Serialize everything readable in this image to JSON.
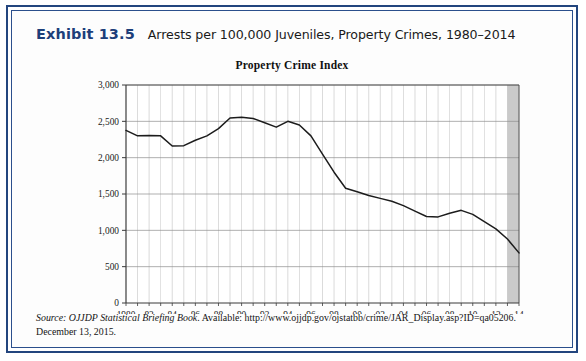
{
  "exhibit": {
    "number": "Exhibit 13.5",
    "caption": "Arrests per 100,000 Juveniles, Property Crimes, 1980–2014"
  },
  "source": {
    "label": "Source:",
    "publication": " OJJDP Statistical Briefing Book",
    "rest": ". Available: http://www.ojjdp.gov/ojstatbb/crime/JAR_Display.asp?ID=qa05206.",
    "line2": "December 13, 2015."
  },
  "colors": {
    "frame_border": "#23457e",
    "exhibit_number": "#1d3f7a",
    "line": "#1c1c1c",
    "grid": "#b9b9b9",
    "axis": "#4a4a4a",
    "shaded_band": "#b8b8b8"
  },
  "chart_data": {
    "type": "line",
    "title": "Property Crime Index",
    "xlabel": "",
    "ylabel": "",
    "xlim": [
      1980,
      2014
    ],
    "ylim": [
      0,
      3000
    ],
    "ytick_values": [
      0,
      500,
      1000,
      1500,
      2000,
      2500,
      3000
    ],
    "ytick_labels": [
      "0",
      "500",
      "1,000",
      "1,500",
      "2,000",
      "2,500",
      "3,000"
    ],
    "xtick_values": [
      1980,
      1982,
      1984,
      1986,
      1988,
      1990,
      1992,
      1994,
      1996,
      1998,
      2000,
      2002,
      2004,
      2006,
      2008,
      2010,
      2012,
      2014
    ],
    "xtick_labels": [
      "1980",
      "82",
      "84",
      "86",
      "88",
      "90",
      "92",
      "94",
      "96",
      "98",
      "00",
      "02",
      "04",
      "06",
      "08",
      "10",
      "12",
      "14"
    ],
    "grid": true,
    "legend": false,
    "shaded_region": {
      "from": 2013,
      "to": 2014
    },
    "x": [
      1980,
      1981,
      1982,
      1983,
      1984,
      1985,
      1986,
      1987,
      1988,
      1989,
      1990,
      1991,
      1992,
      1993,
      1994,
      1995,
      1996,
      1997,
      1998,
      1999,
      2000,
      2001,
      2002,
      2003,
      2004,
      2005,
      2006,
      2007,
      2008,
      2009,
      2010,
      2011,
      2012,
      2013,
      2014
    ],
    "values": [
      2375,
      2300,
      2305,
      2300,
      2160,
      2165,
      2240,
      2300,
      2400,
      2545,
      2555,
      2540,
      2480,
      2420,
      2500,
      2450,
      2300,
      2050,
      1800,
      1580,
      1530,
      1480,
      1440,
      1400,
      1340,
      1265,
      1190,
      1185,
      1235,
      1275,
      1220,
      1120,
      1020,
      880,
      690
    ],
    "series_name": "Property Crime Index"
  }
}
